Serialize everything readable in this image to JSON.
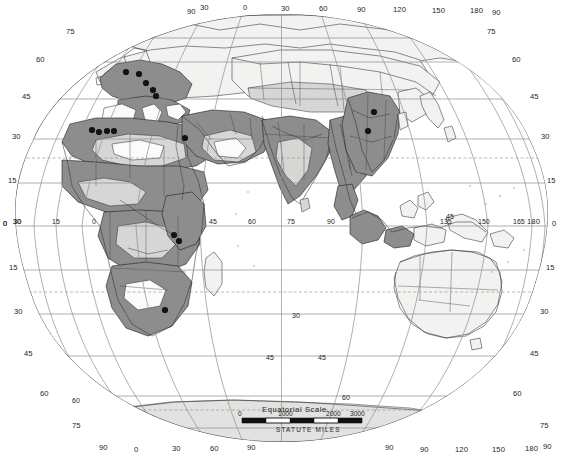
{
  "map": {
    "title": "World distribution map (two-hemisphere oval projection)",
    "projection_note": "Eastern hemisphere oval map with graticule",
    "scale": {
      "title": "Equatorial  Scale",
      "units_label": "STATUTE  MILES",
      "ticks": [
        "0",
        "1000",
        "2000",
        "3000"
      ]
    },
    "colors": {
      "zone_heavy": "#8d8d8d",
      "zone_mid": "#b4b4b2",
      "zone_light": "#d6d6d4",
      "zone_white": "#fbfbfa",
      "land_plain": "#f2f2f0",
      "ice": "#e2e2e0",
      "graticule": "#8e8e90",
      "marker": "#121212",
      "background": "#ffffff"
    },
    "labels": {
      "top": [
        {
          "text": "90",
          "x": 187,
          "y": 14
        },
        {
          "text": "30",
          "x": 200,
          "y": 10
        },
        {
          "text": "0",
          "x": 243,
          "y": 10
        },
        {
          "text": "30",
          "x": 281,
          "y": 11
        },
        {
          "text": "60",
          "x": 319,
          "y": 11
        },
        {
          "text": "90",
          "x": 357,
          "y": 12
        },
        {
          "text": "120",
          "x": 393,
          "y": 12
        },
        {
          "text": "150",
          "x": 432,
          "y": 13
        },
        {
          "text": "180",
          "x": 470,
          "y": 13
        },
        {
          "text": "90",
          "x": 492,
          "y": 15
        }
      ],
      "bottom": [
        {
          "text": "90",
          "x": 99,
          "y": 450
        },
        {
          "text": "0",
          "x": 134,
          "y": 452
        },
        {
          "text": "30",
          "x": 172,
          "y": 451
        },
        {
          "text": "60",
          "x": 210,
          "y": 451
        },
        {
          "text": "90",
          "x": 247,
          "y": 450
        },
        {
          "text": "90",
          "x": 385,
          "y": 450
        },
        {
          "text": "90",
          "x": 420,
          "y": 452
        },
        {
          "text": "120",
          "x": 455,
          "y": 452
        },
        {
          "text": "150",
          "x": 492,
          "y": 452
        },
        {
          "text": "180",
          "x": 525,
          "y": 451
        },
        {
          "text": "90",
          "x": 543,
          "y": 449
        }
      ],
      "left": [
        {
          "text": "75",
          "x": 66,
          "y": 34
        },
        {
          "text": "60",
          "x": 36,
          "y": 62
        },
        {
          "text": "45",
          "x": 22,
          "y": 99
        },
        {
          "text": "30",
          "x": 12,
          "y": 139
        },
        {
          "text": "15",
          "x": 8,
          "y": 183
        },
        {
          "text": "0",
          "x": 3,
          "y": 226
        },
        {
          "text": "30",
          "x": 13,
          "y": 224
        },
        {
          "text": "15",
          "x": 9,
          "y": 270
        },
        {
          "text": "30",
          "x": 14,
          "y": 314
        },
        {
          "text": "45",
          "x": 24,
          "y": 356
        },
        {
          "text": "60",
          "x": 40,
          "y": 396
        },
        {
          "text": "75",
          "x": 72,
          "y": 428
        }
      ],
      "right": [
        {
          "text": "75",
          "x": 487,
          "y": 34
        },
        {
          "text": "60",
          "x": 512,
          "y": 62
        },
        {
          "text": "45",
          "x": 530,
          "y": 99
        },
        {
          "text": "30",
          "x": 541,
          "y": 139
        },
        {
          "text": "15",
          "x": 547,
          "y": 183
        },
        {
          "text": "180",
          "x": 527,
          "y": 224
        },
        {
          "text": "0",
          "x": 552,
          "y": 226
        },
        {
          "text": "15",
          "x": 546,
          "y": 270
        },
        {
          "text": "30",
          "x": 540,
          "y": 314
        },
        {
          "text": "45",
          "x": 530,
          "y": 356
        },
        {
          "text": "60",
          "x": 513,
          "y": 396
        },
        {
          "text": "75",
          "x": 540,
          "y": 428
        }
      ],
      "equator": [
        {
          "text": "0",
          "x": 3,
          "y": 226
        },
        {
          "text": "30",
          "x": 13,
          "y": 224
        },
        {
          "text": "15",
          "x": 52,
          "y": 224
        },
        {
          "text": "0",
          "x": 92,
          "y": 224
        },
        {
          "text": "45",
          "x": 209,
          "y": 224
        },
        {
          "text": "60",
          "x": 248,
          "y": 224
        },
        {
          "text": "75",
          "x": 287,
          "y": 224
        },
        {
          "text": "90",
          "x": 327,
          "y": 224
        },
        {
          "text": "135",
          "x": 440,
          "y": 224
        },
        {
          "text": "150",
          "x": 478,
          "y": 224
        },
        {
          "text": "165",
          "x": 513,
          "y": 224
        }
      ],
      "interior": [
        {
          "text": "45",
          "x": 266,
          "y": 360
        },
        {
          "text": "45",
          "x": 318,
          "y": 360
        },
        {
          "text": "30",
          "x": 292,
          "y": 318
        },
        {
          "text": "45",
          "x": 446,
          "y": 219
        },
        {
          "text": "60",
          "x": 72,
          "y": 403
        },
        {
          "text": "60",
          "x": 342,
          "y": 400
        }
      ]
    },
    "markers": [
      {
        "name": "marker-europe-1",
        "cx": 126,
        "cy": 72
      },
      {
        "name": "marker-europe-2",
        "cx": 139,
        "cy": 74
      },
      {
        "name": "marker-europe-3",
        "cx": 146,
        "cy": 83
      },
      {
        "name": "marker-europe-4",
        "cx": 153,
        "cy": 90
      },
      {
        "name": "marker-europe-5",
        "cx": 156,
        "cy": 96
      },
      {
        "name": "marker-nafrica-1",
        "cx": 92,
        "cy": 130
      },
      {
        "name": "marker-nafrica-2",
        "cx": 99,
        "cy": 132
      },
      {
        "name": "marker-nafrica-3",
        "cx": 107,
        "cy": 131
      },
      {
        "name": "marker-nafrica-4",
        "cx": 114,
        "cy": 131
      },
      {
        "name": "marker-levant",
        "cx": 185,
        "cy": 138
      },
      {
        "name": "marker-eafrica-1",
        "cx": 174,
        "cy": 235
      },
      {
        "name": "marker-eafrica-2",
        "cx": 179,
        "cy": 241
      },
      {
        "name": "marker-safrica",
        "cx": 165,
        "cy": 310
      },
      {
        "name": "marker-echina-1",
        "cx": 374,
        "cy": 112
      },
      {
        "name": "marker-echina-2",
        "cx": 368,
        "cy": 131
      }
    ]
  }
}
